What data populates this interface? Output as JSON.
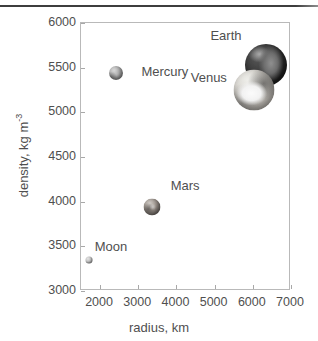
{
  "chart_data": {
    "type": "scatter",
    "title": "",
    "xlabel": "radius, km",
    "ylabel": "density, kg m",
    "ylabel_exponent": "-3",
    "xlim": [
      1500,
      7000
    ],
    "ylim": [
      3000,
      6000
    ],
    "xticks": [
      2000,
      3000,
      4000,
      5000,
      6000,
      7000
    ],
    "xtick_labels": [
      "2000",
      "3000",
      "4000",
      "5000",
      "6000",
      "7000"
    ],
    "yticks": [
      3000,
      3500,
      4000,
      4500,
      5000,
      5500,
      6000
    ],
    "ytick_labels": [
      "3000",
      "3500",
      "4000",
      "4500",
      "5000",
      "5500",
      "6000"
    ],
    "grid": false,
    "legend": "none",
    "points": [
      {
        "name": "Moon",
        "label": "Moon",
        "x": 1737,
        "y": 3340,
        "marker": "moon-sphere",
        "marker_px": 7,
        "label_dx": 22,
        "label_dy": -14
      },
      {
        "name": "Mercury",
        "label": "Mercury",
        "x": 2440,
        "y": 5430,
        "marker": "mercury-sphere",
        "marker_px": 14,
        "label_dx": 49,
        "label_dy": -2
      },
      {
        "name": "Mars",
        "label": "Mars",
        "x": 3390,
        "y": 3930,
        "marker": "mars-sphere",
        "marker_px": 17,
        "label_dx": 33,
        "label_dy": -22
      },
      {
        "name": "Venus",
        "label": "Venus",
        "x": 6052,
        "y": 5240,
        "marker": "venus-sphere",
        "marker_px": 41,
        "label_dx": -45,
        "label_dy": -13
      },
      {
        "name": "Earth",
        "label": "Earth",
        "x": 6371,
        "y": 5515,
        "marker": "earth-sphere",
        "marker_px": 42,
        "label_dx": -40,
        "label_dy": -30
      }
    ]
  },
  "colors": {
    "axis_line": "#b9b9b9",
    "tick": "#a8a8a8",
    "text": "#4f4f4f",
    "top_rule": "#3d3d3d",
    "background": "#ffffff"
  }
}
